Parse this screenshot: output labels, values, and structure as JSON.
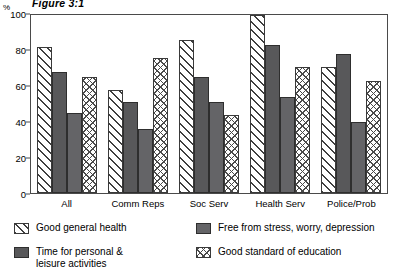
{
  "chart_data": {
    "type": "bar",
    "title": "Figure 3:1",
    "xlabel": "",
    "ylabel": "%",
    "ylim": [
      0,
      100
    ],
    "yticks": [
      0,
      20,
      40,
      60,
      80,
      100
    ],
    "grid": false,
    "legend_position": "bottom",
    "categories": [
      "All",
      "Comm Reps",
      "Soc Serv",
      "Health Serv",
      "Police/Prob"
    ],
    "series": [
      {
        "name": "Good general health",
        "pattern": "diagonal-hatch",
        "values": [
          82,
          58,
          86,
          100,
          71
        ]
      },
      {
        "name": "Time for personal & leisure activities",
        "pattern": "solid-dark-grey",
        "values": [
          68,
          51,
          65,
          83,
          78
        ]
      },
      {
        "name": "Free from stress, worry, depression",
        "pattern": "solid-mid-grey",
        "values": [
          45,
          36,
          51,
          54,
          40
        ]
      },
      {
        "name": "Good standard of education",
        "pattern": "cross-hatch",
        "values": [
          65,
          76,
          44,
          71,
          63
        ]
      }
    ]
  },
  "legend": {
    "items": [
      {
        "label": "Good general health"
      },
      {
        "label": "Free from stress, worry, depression"
      },
      {
        "label": "Time for personal &\nleisure activities"
      },
      {
        "label": "Good standard of education"
      }
    ]
  },
  "colors": {
    "series_0": "#ffffff",
    "series_1": "#58585a",
    "series_2": "#646467",
    "series_3": "#ffffff",
    "axis": "#4a4a4a",
    "text": "#000000"
  }
}
